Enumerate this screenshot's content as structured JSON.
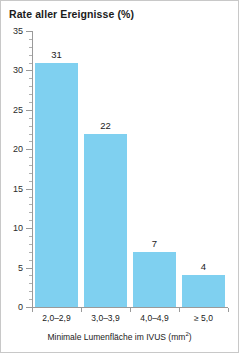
{
  "chart_data": {
    "type": "bar",
    "title": "Rate aller Ereignisse (%)",
    "xlabel": "Minimale Lumenfläche im IVUS (mm²)",
    "ylabel": "",
    "categories": [
      "2,0–2,9",
      "3,0–3,9",
      "4,0–4,9",
      "≥ 5,0"
    ],
    "values": [
      31,
      22,
      7,
      4
    ],
    "value_labels": [
      "31",
      "22",
      "7",
      "4"
    ],
    "ylim": [
      0,
      35
    ],
    "y_ticks": [
      0,
      5,
      10,
      15,
      20,
      25,
      30,
      35
    ],
    "y_tick_labels": [
      "0",
      "5",
      "10",
      "15",
      "20",
      "25",
      "30",
      "35"
    ],
    "y_minor_tick_step": 1,
    "grid": false,
    "legend": null,
    "bar_color": "#7fd0f0",
    "axis_color": "#9a9a9a",
    "frame_color": "#c8c8c8",
    "background": "#ffffff"
  },
  "axis_title_parts": {
    "main": "Minimale Lumenfläche im IVUS (mm",
    "superscript": "2",
    "tail": ")"
  }
}
